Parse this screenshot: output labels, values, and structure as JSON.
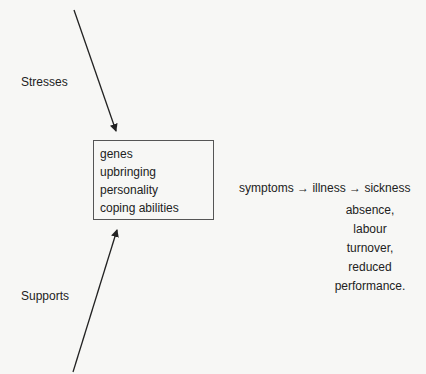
{
  "diagram": {
    "stresses_label": "Stresses",
    "supports_label": "Supports",
    "box_items": [
      "genes",
      "upbringing",
      "personality",
      "coping abilities"
    ],
    "chain": {
      "step1": "symptoms",
      "arrow1": "→",
      "step2": "illness",
      "arrow2": "→",
      "step3": "sickness"
    },
    "outcomes": [
      "absence,",
      "labour",
      "turnover,",
      "reduced",
      "performance."
    ]
  }
}
